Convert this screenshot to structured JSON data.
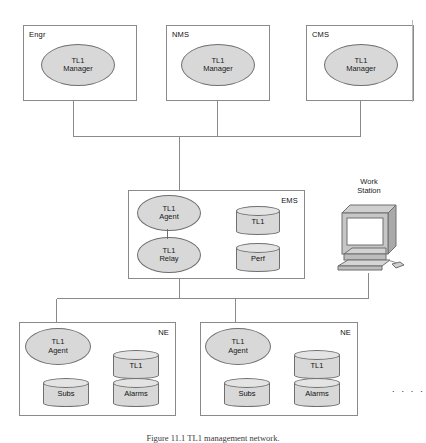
{
  "figure": {
    "caption": "Figure 11.1   TL1 management network.",
    "ellipsis": ". . . ."
  },
  "tiers": {
    "managers": [
      {
        "id": "engr",
        "title": "Engr",
        "node": {
          "line1": "TL1",
          "line2": "Manager"
        }
      },
      {
        "id": "nms",
        "title": "NMS",
        "node": {
          "line1": "TL1",
          "line2": "Manager"
        }
      },
      {
        "id": "cms",
        "title": "CMS",
        "node": {
          "line1": "TL1",
          "line2": "Manager"
        }
      }
    ],
    "ems": {
      "title": "EMS",
      "agent": {
        "line1": "TL1",
        "line2": "Agent"
      },
      "relay": {
        "line1": "TL1",
        "line2": "Relay"
      },
      "stores": [
        {
          "label": "TL1"
        },
        {
          "label": "Perf"
        }
      ]
    },
    "workstation": {
      "label_line1": "Work",
      "label_line2": "Station",
      "icon": "workstation-icon"
    },
    "network_elements": [
      {
        "id": "ne-left",
        "title": "NE",
        "agent": {
          "line1": "TL1",
          "line2": "Agent"
        },
        "stores": [
          {
            "label": "TL1"
          },
          {
            "label": "Subs"
          },
          {
            "label": "Alarms"
          }
        ]
      },
      {
        "id": "ne-right",
        "title": "NE",
        "agent": {
          "line1": "TL1",
          "line2": "Agent"
        },
        "stores": [
          {
            "label": "TL1"
          },
          {
            "label": "Subs"
          },
          {
            "label": "Alarms"
          }
        ]
      }
    ]
  },
  "colors": {
    "line": "#8a8a8a",
    "node_fill": "#d8d8d8",
    "node_stroke": "#6f6f6f",
    "cylinder_top": "#e4e4e4",
    "text": "#1a1a1a",
    "background": "#ffffff"
  }
}
